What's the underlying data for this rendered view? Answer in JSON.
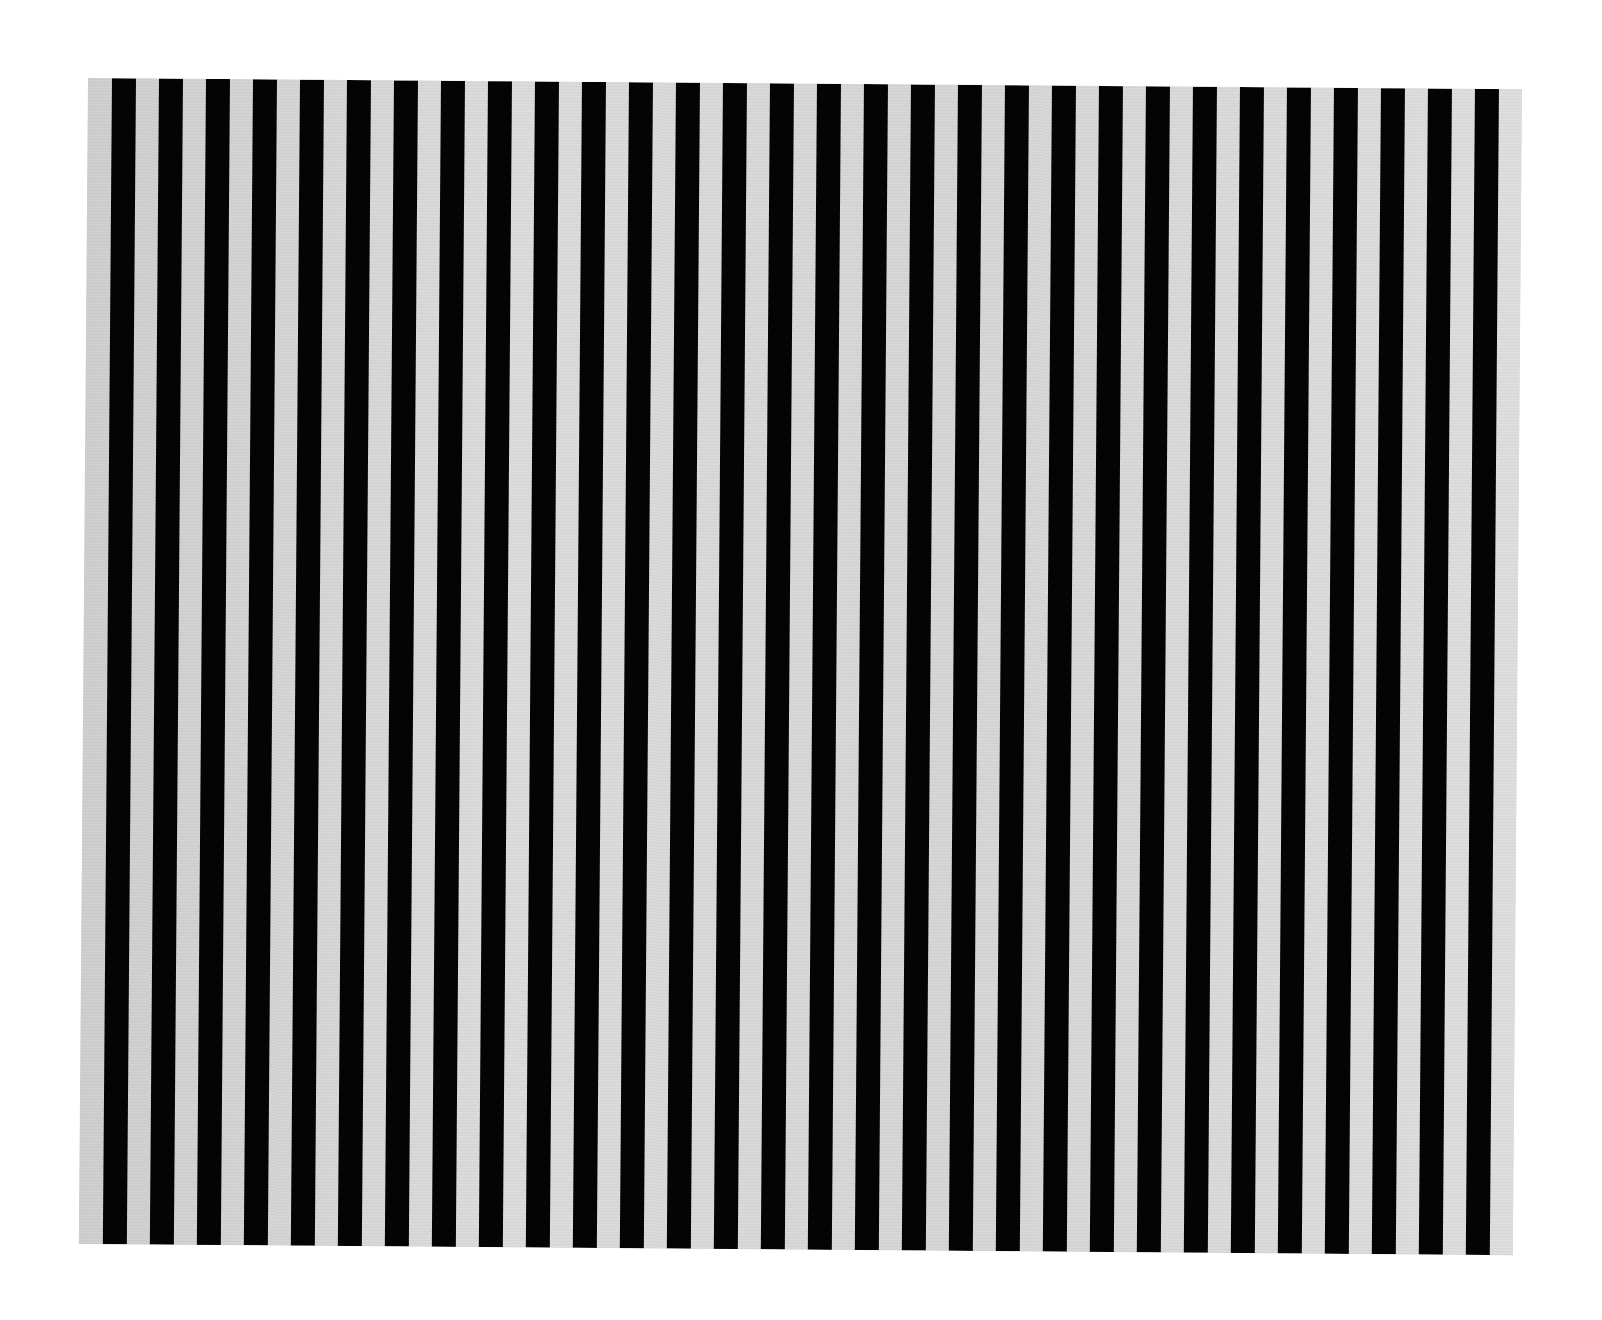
{
  "artwork": {
    "description": "Black vertical stripes on light grey textured ground",
    "colors": {
      "stripe": "#040404",
      "ground": "#d9d9d9",
      "background": "#ffffff"
    },
    "canvas": {
      "left": 88,
      "top": 78,
      "width": 1434,
      "height": 1166
    },
    "stripes": {
      "count": 30,
      "first_offset": 24,
      "pitch": 47.0,
      "width": 23.5
    }
  }
}
